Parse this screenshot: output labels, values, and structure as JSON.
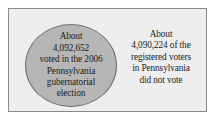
{
  "figure": {
    "type": "venn-style-region-diagram",
    "panel": {
      "background_color": "#eeeeee",
      "border_color": "#8a8a8a"
    }
  },
  "circle_region": {
    "name": "voted-circle",
    "fill_color": "#b6b6b6",
    "border_color": "#6f6f6f",
    "lines": [
      "About",
      "4,092,652",
      "voted in the 2006",
      "Pennsylvania",
      "gubernatorial",
      "election"
    ],
    "value": "4,092,652",
    "full_text": "About 4,092,652 voted in the 2006 Pennsylvania gubernatorial election"
  },
  "outside_region": {
    "name": "did-not-vote-text",
    "lines": [
      "About",
      "4,090,224 of the",
      "registered voters",
      "in Pennsylvania",
      "did not vote"
    ],
    "value": "4,090,224",
    "full_text": "About 4,090,224 of the registered voters in Pennsylvania did not vote"
  }
}
